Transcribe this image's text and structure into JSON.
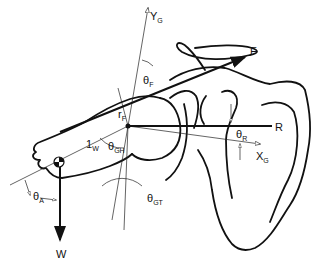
{
  "figure": {
    "labels": {
      "y_axis": {
        "main": "Y",
        "sub": "G"
      },
      "x_axis": {
        "main": "X",
        "sub": "G"
      },
      "force_F": {
        "main": "F",
        "sub": ""
      },
      "force_R": {
        "main": "R",
        "sub": ""
      },
      "force_W": {
        "main": "W",
        "sub": ""
      },
      "theta_F": {
        "main": "θ",
        "sub": "F"
      },
      "theta_R": {
        "main": "θ",
        "sub": "R"
      },
      "theta_GH": {
        "main": "θ",
        "sub": "GH"
      },
      "theta_GT": {
        "main": "θ",
        "sub": "GT"
      },
      "theta_A": {
        "main": "θ",
        "sub": "A"
      },
      "r_F": {
        "main": "r",
        "sub": "F"
      },
      "l_W": {
        "main": "1",
        "sub": "W"
      }
    },
    "colors": {
      "ink": "#111111",
      "background": "#ffffff"
    }
  }
}
